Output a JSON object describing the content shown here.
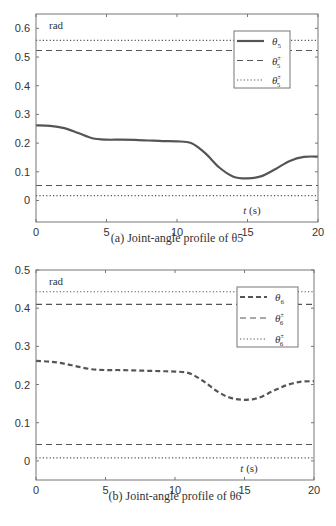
{
  "chart_data": [
    {
      "type": "line",
      "title": "",
      "caption": "(a) Joint-angle profile of θ5",
      "xlabel": "t (s)",
      "ylabel": "rad",
      "xlim": [
        0,
        20
      ],
      "ylim": [
        -0.075,
        0.65
      ],
      "xticks": [
        0,
        5,
        10,
        15,
        20
      ],
      "yticks": [
        0,
        0.1,
        0.2,
        0.3,
        0.4,
        0.5,
        0.6
      ],
      "grid": false,
      "legend_position": "upper right",
      "series": [
        {
          "name": "θ5",
          "style": "solid",
          "x": [
            0,
            1,
            2,
            3,
            4,
            5,
            6,
            7,
            8,
            9,
            10,
            11,
            12,
            13,
            14,
            15,
            16,
            17,
            18,
            19,
            20
          ],
          "values": [
            0.262,
            0.26,
            0.252,
            0.235,
            0.217,
            0.212,
            0.212,
            0.211,
            0.209,
            0.207,
            0.206,
            0.2,
            0.165,
            0.115,
            0.083,
            0.077,
            0.085,
            0.11,
            0.138,
            0.152,
            0.153
          ]
        },
        {
          "name": "θ5 upper limit (dashed)",
          "style": "dashed",
          "x": [
            0,
            20
          ],
          "values": [
            0.523,
            0.523
          ]
        },
        {
          "name": "θ5 upper bound (dotted)",
          "style": "dotted",
          "x": [
            0,
            20
          ],
          "values": [
            0.558,
            0.558
          ]
        },
        {
          "name": "θ5 lower limit (dashed)",
          "style": "dashed",
          "x": [
            0,
            20
          ],
          "values": [
            0.052,
            0.052
          ]
        },
        {
          "name": "θ5 lower bound (dotted)",
          "style": "dotted",
          "x": [
            0,
            20
          ],
          "values": [
            0.017,
            0.017
          ]
        }
      ],
      "legend": [
        {
          "label": "θ",
          "sub": "5",
          "sup": "",
          "style": "solid"
        },
        {
          "label": "θ",
          "sub": "5",
          "sup": "±",
          "style": "dashed"
        },
        {
          "label": "θ",
          "sub": "5",
          "sup": "±",
          "style": "dotted"
        }
      ]
    },
    {
      "type": "line",
      "title": "",
      "caption": "(b) Joint-angle profile of θ6",
      "xlabel": "t (s)",
      "ylabel": "rad",
      "xlim": [
        0,
        20
      ],
      "ylim": [
        -0.05,
        0.5
      ],
      "xticks": [
        0,
        5,
        10,
        15,
        20
      ],
      "yticks": [
        0,
        0.1,
        0.2,
        0.3,
        0.4,
        0.5
      ],
      "grid": false,
      "legend_position": "upper right",
      "series": [
        {
          "name": "θ6",
          "style": "dashed-thick",
          "x": [
            0,
            1,
            2,
            3,
            4,
            5,
            6,
            7,
            8,
            9,
            10,
            11,
            12,
            13,
            14,
            15,
            16,
            17,
            18,
            19,
            20
          ],
          "values": [
            0.262,
            0.26,
            0.255,
            0.247,
            0.24,
            0.238,
            0.238,
            0.237,
            0.236,
            0.235,
            0.234,
            0.23,
            0.21,
            0.183,
            0.165,
            0.16,
            0.165,
            0.182,
            0.198,
            0.207,
            0.209
          ]
        },
        {
          "name": "θ6 upper limit (dashed)",
          "style": "dashed",
          "x": [
            0,
            20
          ],
          "values": [
            0.41,
            0.41
          ]
        },
        {
          "name": "θ6 upper bound (dotted)",
          "style": "dotted",
          "x": [
            0,
            20
          ],
          "values": [
            0.443,
            0.443
          ]
        },
        {
          "name": "θ6 lower limit (dashed)",
          "style": "dashed",
          "x": [
            0,
            20
          ],
          "values": [
            0.043,
            0.043
          ]
        },
        {
          "name": "θ6 lower bound (dotted)",
          "style": "dotted",
          "x": [
            0,
            20
          ],
          "values": [
            0.008,
            0.008
          ]
        }
      ],
      "legend": [
        {
          "label": "θ",
          "sub": "6",
          "sup": "",
          "style": "dashed-thick"
        },
        {
          "label": "θ",
          "sub": "6",
          "sup": "±",
          "style": "dashed"
        },
        {
          "label": "θ",
          "sub": "6",
          "sup": "±",
          "style": "dotted"
        }
      ]
    }
  ],
  "colors": {
    "curve": "#555555",
    "axis": "#777777",
    "text": "#333333"
  }
}
